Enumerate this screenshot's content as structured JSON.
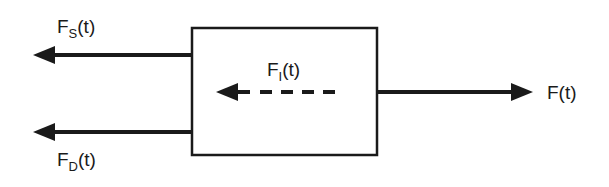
{
  "diagram": {
    "type": "free-body diagram",
    "stroke_color": "#1a1a1a",
    "background": "#ffffff",
    "body": {
      "shape": "rectangle"
    },
    "forces": [
      {
        "id": "spring",
        "symbol": "F",
        "subscript": "S",
        "arg": "(t)",
        "direction": "left",
        "style": "solid"
      },
      {
        "id": "damping",
        "symbol": "F",
        "subscript": "D",
        "arg": "(t)",
        "direction": "left",
        "style": "solid"
      },
      {
        "id": "inertia",
        "symbol": "F",
        "subscript": "I",
        "arg": "(t)",
        "direction": "left",
        "style": "dashed"
      },
      {
        "id": "applied",
        "symbol": "F",
        "subscript": "",
        "arg": "(t)",
        "direction": "right",
        "style": "solid"
      }
    ]
  }
}
